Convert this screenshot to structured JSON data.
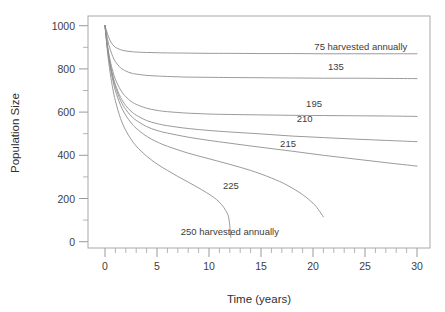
{
  "chart_data": {
    "type": "line",
    "title": "",
    "xlabel": "Time (years)",
    "ylabel": "Population Size",
    "xlim": [
      0,
      30
    ],
    "ylim": [
      0,
      1000
    ],
    "grid": false,
    "legend_position": "inline-labels",
    "xticks": [
      0,
      5,
      10,
      15,
      20,
      25,
      30
    ],
    "xticklabels": [
      "0",
      "5",
      "10",
      "15",
      "20",
      "25",
      "30"
    ],
    "xminor_step": 1,
    "yticks": [
      0,
      200,
      400,
      600,
      800,
      1000
    ],
    "yticklabels": [
      "0",
      "200",
      "400",
      "600",
      "800",
      "1000"
    ],
    "yminor_step": 100,
    "line_color": "#8f8f8f",
    "frame_color": "#a8a8a8",
    "series": [
      {
        "name": "75 harvested annually",
        "label": "75 harvested annually",
        "label_x": 24.6,
        "label_y": 905,
        "x": [
          0,
          0.25,
          0.5,
          0.75,
          1,
          1.5,
          2,
          2.5,
          3,
          4,
          5,
          6,
          8,
          10,
          12,
          15,
          18,
          21,
          24,
          27,
          30
        ],
        "values": [
          1000,
          960,
          930,
          912,
          900,
          889,
          883,
          880,
          878,
          876,
          875,
          874,
          873,
          872,
          872,
          871,
          871,
          870,
          870,
          870,
          870
        ]
      },
      {
        "name": "135 harvested annually",
        "label": "135",
        "label_x": 22.2,
        "label_y": 810,
        "x": [
          0,
          0.25,
          0.5,
          0.75,
          1,
          1.5,
          2,
          2.5,
          3,
          4,
          5,
          6,
          8,
          10,
          12,
          15,
          18,
          21,
          24,
          27,
          30
        ],
        "values": [
          1000,
          935,
          890,
          857,
          834,
          805,
          790,
          781,
          776,
          770,
          767,
          765,
          762,
          761,
          760,
          759,
          758,
          757,
          757,
          756,
          755
        ]
      },
      {
        "name": "195 harvested annually",
        "label": "195",
        "label_x": 20.1,
        "label_y": 640,
        "x": [
          0,
          0.25,
          0.5,
          0.75,
          1,
          1.5,
          2,
          2.5,
          3,
          4,
          5,
          6,
          8,
          10,
          12,
          15,
          18,
          21,
          24,
          27,
          30
        ],
        "values": [
          1000,
          905,
          838,
          789,
          752,
          702,
          671,
          650,
          636,
          618,
          608,
          602,
          595,
          591,
          589,
          587,
          585,
          584,
          583,
          582,
          580
        ]
      },
      {
        "name": "210 harvested annually",
        "label": "210",
        "label_x": 19.2,
        "label_y": 570,
        "x": [
          0,
          0.25,
          0.5,
          0.75,
          1,
          1.5,
          2,
          2.5,
          3,
          4,
          5,
          6,
          8,
          10,
          12,
          15,
          18,
          21,
          24,
          27,
          30
        ],
        "values": [
          1000,
          898,
          824,
          769,
          727,
          668,
          630,
          604,
          586,
          561,
          547,
          537,
          524,
          515,
          508,
          499,
          489,
          482,
          475,
          469,
          463
        ]
      },
      {
        "name": "215 harvested annually",
        "label": "215",
        "label_x": 17.6,
        "label_y": 455,
        "x": [
          0,
          0.25,
          0.5,
          0.75,
          1,
          1.5,
          2,
          2.5,
          3,
          4,
          5,
          6,
          8,
          10,
          12,
          15,
          18,
          21,
          24,
          27,
          30
        ],
        "values": [
          1000,
          895,
          818,
          761,
          716,
          653,
          612,
          583,
          562,
          533,
          515,
          503,
          484,
          469,
          456,
          437,
          419,
          400,
          383,
          366,
          350
        ]
      },
      {
        "name": "225 harvested annually",
        "label": "225",
        "label_x": 12.1,
        "label_y": 258,
        "x": [
          0,
          0.25,
          0.5,
          0.75,
          1,
          1.5,
          2,
          2.5,
          3,
          4,
          5,
          6,
          8,
          10,
          12,
          14,
          16,
          17.5,
          19,
          20,
          20.5,
          21
        ],
        "values": [
          1000,
          890,
          808,
          747,
          699,
          631,
          585,
          551,
          525,
          488,
          462,
          442,
          410,
          384,
          358,
          330,
          295,
          262,
          218,
          178,
          150,
          115
        ]
      },
      {
        "name": "250 harvested annually",
        "label": "250 harvested annually",
        "label_x": 12.0,
        "label_y": 45,
        "x": [
          0,
          0.25,
          0.5,
          0.75,
          1,
          1.5,
          2,
          2.5,
          3,
          4,
          5,
          6,
          7,
          8,
          9,
          10,
          10.7,
          11.2,
          11.6,
          11.9,
          12.1
        ],
        "values": [
          1000,
          875,
          780,
          708,
          652,
          570,
          515,
          475,
          443,
          396,
          360,
          330,
          302,
          276,
          249,
          220,
          196,
          172,
          145,
          110,
          20
        ]
      }
    ]
  }
}
